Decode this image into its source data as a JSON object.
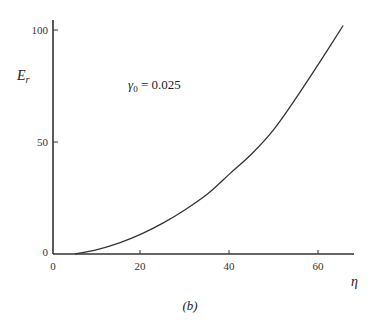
{
  "chart_data": {
    "type": "line",
    "title": "",
    "xlabel": "η",
    "ylabel": "E_r",
    "xlim": [
      0,
      68
    ],
    "ylim": [
      0,
      105
    ],
    "xticks": [
      0,
      20,
      40,
      60
    ],
    "yticks": [
      0,
      50,
      100
    ],
    "grid": false,
    "legend": null,
    "annotations": [
      {
        "text": "γ₀ = 0.025",
        "x": 17,
        "y": 76
      }
    ],
    "caption": "(b)",
    "series": [
      {
        "name": "E_r(η), γ0 = 0.025",
        "x": [
          5,
          10,
          15,
          20,
          25,
          30,
          35,
          40,
          45,
          50,
          55,
          60,
          65.5
        ],
        "y": [
          0,
          2,
          5,
          9,
          14,
          20,
          27,
          36,
          45,
          56,
          70,
          85,
          102
        ]
      }
    ]
  },
  "labels": {
    "xlabel": "η",
    "ylabel_main": "E",
    "ylabel_sub": "r",
    "annotation_gamma": "γ",
    "annotation_sub": "0",
    "annotation_rest": " = 0.025",
    "caption": "(b)",
    "xtick_0": "0",
    "xtick_20": "20",
    "xtick_40": "40",
    "xtick_60": "60",
    "ytick_0": "0",
    "ytick_50": "50",
    "ytick_100": "100"
  }
}
